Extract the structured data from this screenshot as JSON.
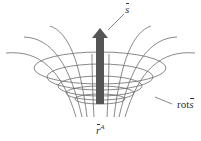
{
  "figure": {
    "type": "vector-field-diagram",
    "colors": {
      "lines": "#6b6b6b",
      "arrow": "#555555",
      "text": "#333333",
      "background": "#ffffff"
    }
  },
  "labels": {
    "top_vector": "s",
    "right_prefix": "rot",
    "right_vector": "s",
    "bottom_vector": "r",
    "bottom_superscript": "A"
  }
}
